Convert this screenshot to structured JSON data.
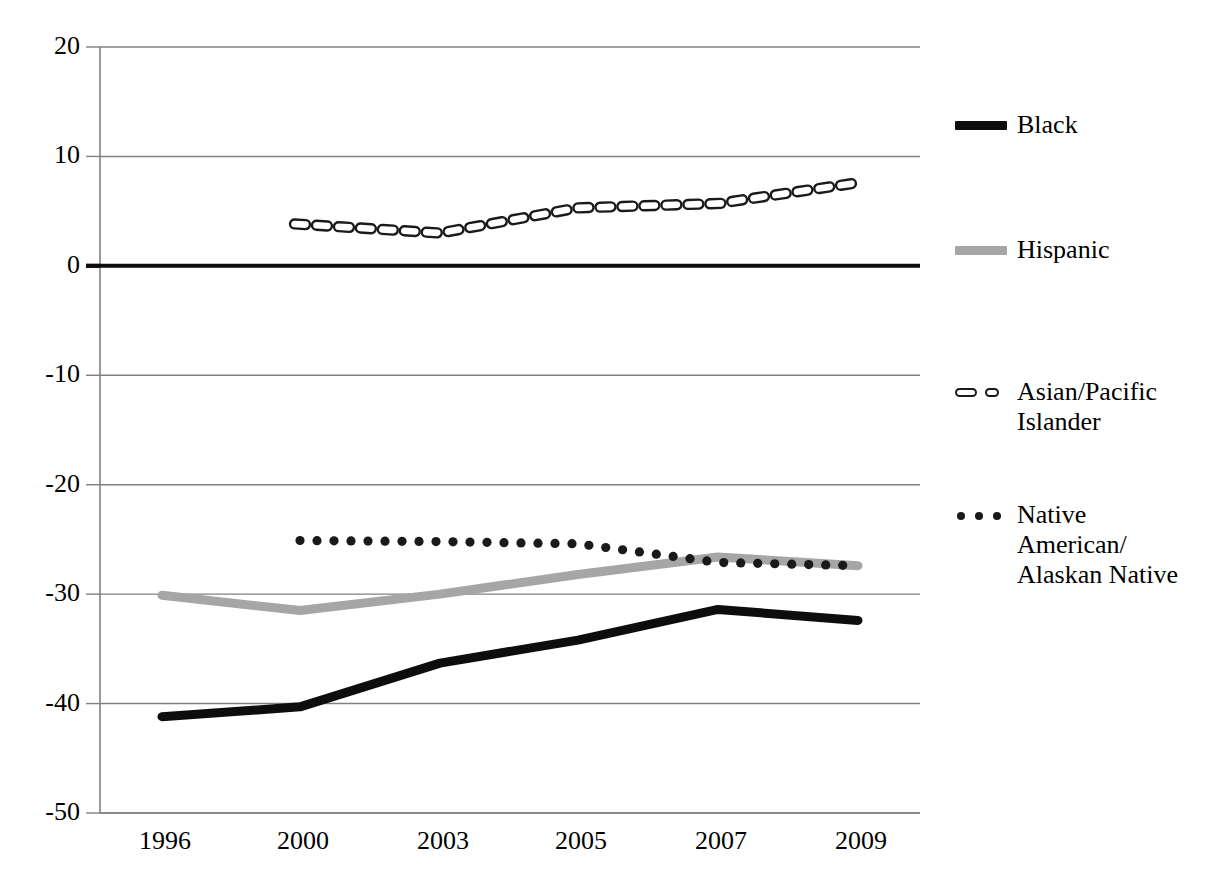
{
  "chart_data": {
    "type": "line",
    "title": "",
    "subtitle": "",
    "xlabel": "",
    "ylabel": "",
    "categories": [
      "1996",
      "2000",
      "2003",
      "2005",
      "2007",
      "2009"
    ],
    "x_tick_labels": [
      "1996",
      "2000",
      "2003",
      "2005",
      "2007",
      "2009"
    ],
    "y_tick_labels": [
      "20",
      "10",
      "0",
      "-10",
      "-20",
      "-30",
      "-40",
      "-50"
    ],
    "y_ticks": [
      20,
      10,
      0,
      -10,
      -20,
      -30,
      -40,
      -50
    ],
    "ylim": [
      -50,
      20
    ],
    "grid": "horizontal",
    "zero_line": true,
    "legend_position": "right",
    "series": [
      {
        "name": "Black",
        "style": "solid-thick",
        "color": "#0d0d0d",
        "x": [
          "1996",
          "2000",
          "2003",
          "2005",
          "2007",
          "2009"
        ],
        "values": [
          -41.2,
          -40.3,
          -36.3,
          -34.2,
          -31.4,
          -32.4
        ]
      },
      {
        "name": "Hispanic",
        "style": "solid-thick",
        "color": "#a6a6a6",
        "x": [
          "1996",
          "2000",
          "2003",
          "2005",
          "2007",
          "2009"
        ],
        "values": [
          -30.1,
          -31.5,
          -30.0,
          -28.2,
          -26.6,
          -27.4
        ]
      },
      {
        "name": "Asian/Pacific Islander",
        "style": "dashed",
        "color": "#1a1a1a",
        "x": [
          "2000",
          "2003",
          "2005",
          "2007",
          "2009"
        ],
        "values": [
          3.8,
          3.0,
          5.3,
          5.7,
          7.6
        ]
      },
      {
        "name": "Native American/Alaskan Native",
        "style": "dotted",
        "color": "#1a1a1a",
        "x": [
          "2000",
          "2003",
          "2005",
          "2007",
          "2009"
        ],
        "values": [
          -25.1,
          -25.2,
          -25.4,
          -27.1,
          -27.4
        ]
      }
    ]
  },
  "legend": {
    "entries": [
      {
        "label": "Black",
        "swatch": "solid-black-line-swatch"
      },
      {
        "label": "Hispanic",
        "swatch": "solid-gray-line-swatch"
      },
      {
        "label": "Asian/Pacific\nIslander",
        "swatch": "dashed-line-swatch"
      },
      {
        "label": "Native\nAmerican/\nAlaskan Native",
        "swatch": "dotted-line-swatch"
      }
    ]
  },
  "caption": {
    "text": ""
  },
  "colors": {
    "black_series": "#0d0d0d",
    "hispanic_series": "#a6a6a6",
    "gridline": "#808080",
    "axis": "#808080",
    "zero_line": "#0d0d0d",
    "background": "#ffffff"
  }
}
